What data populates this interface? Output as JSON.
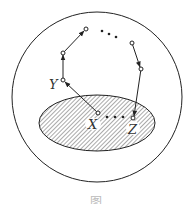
{
  "diagram": {
    "labels": {
      "x": "X",
      "y": "Y",
      "z": "Z",
      "caption": "图"
    },
    "colors": {
      "stroke": "#222222",
      "hatch": "#555555",
      "background": "#ffffff"
    },
    "outer_circle": {
      "cx": 97,
      "cy": 97,
      "r": 85
    },
    "shaded_ellipse": {
      "cx": 97,
      "cy": 123,
      "rx": 58,
      "ry": 28
    },
    "path_nodes": [
      {
        "id": "X",
        "x": 98,
        "y": 113
      },
      {
        "id": "Y",
        "x": 63,
        "y": 80
      },
      {
        "id": "n2",
        "x": 63,
        "y": 53
      },
      {
        "id": "n3",
        "x": 86,
        "y": 29
      },
      {
        "id": "n4",
        "x": 132,
        "y": 43
      },
      {
        "id": "n5",
        "x": 141,
        "y": 69
      },
      {
        "id": "Z",
        "x": 133,
        "y": 118
      }
    ],
    "ellipsis_dots": [
      "top",
      "between-X-and-Z"
    ]
  }
}
